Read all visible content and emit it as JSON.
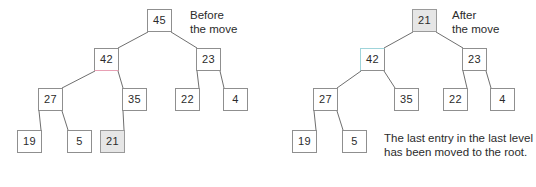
{
  "figure": {
    "panels": [
      {
        "id": "before",
        "label": "Before\nthe move",
        "label_pos": {
          "x": 190,
          "y": 8
        },
        "nodes": [
          {
            "id": "b45",
            "value": "45",
            "x": 147,
            "y": 9,
            "style": "plain"
          },
          {
            "id": "b42",
            "value": "42",
            "x": 94,
            "y": 48,
            "style": "accent-bottom"
          },
          {
            "id": "b23",
            "value": "23",
            "x": 196,
            "y": 48,
            "style": "plain"
          },
          {
            "id": "b27",
            "value": "27",
            "x": 38,
            "y": 88,
            "style": "plain"
          },
          {
            "id": "b35",
            "value": "35",
            "x": 122,
            "y": 88,
            "style": "plain"
          },
          {
            "id": "b22",
            "value": "22",
            "x": 175,
            "y": 88,
            "style": "plain"
          },
          {
            "id": "b4",
            "value": "4",
            "x": 223,
            "y": 88,
            "style": "plain"
          },
          {
            "id": "b19",
            "value": "19",
            "x": 17,
            "y": 130,
            "style": "plain"
          },
          {
            "id": "b5",
            "value": "5",
            "x": 67,
            "y": 130,
            "style": "plain"
          },
          {
            "id": "b21",
            "value": "21",
            "x": 100,
            "y": 130,
            "style": "highlight"
          }
        ],
        "edges": [
          {
            "from": "b45",
            "to": "b42"
          },
          {
            "from": "b45",
            "to": "b23"
          },
          {
            "from": "b42",
            "to": "b27"
          },
          {
            "from": "b42",
            "to": "b35"
          },
          {
            "from": "b23",
            "to": "b22"
          },
          {
            "from": "b23",
            "to": "b4"
          },
          {
            "from": "b27",
            "to": "b19"
          },
          {
            "from": "b27",
            "to": "b5"
          },
          {
            "from": "b35",
            "to": "b21"
          }
        ]
      },
      {
        "id": "after",
        "label": "After\nthe move",
        "label_pos": {
          "x": 452,
          "y": 8
        },
        "nodes": [
          {
            "id": "a21",
            "value": "21",
            "x": 412,
            "y": 9,
            "style": "highlight"
          },
          {
            "id": "a42",
            "value": "42",
            "x": 360,
            "y": 48,
            "style": "accent-top"
          },
          {
            "id": "a23",
            "value": "23",
            "x": 462,
            "y": 48,
            "style": "plain"
          },
          {
            "id": "a27",
            "value": "27",
            "x": 313,
            "y": 88,
            "style": "plain"
          },
          {
            "id": "a35",
            "value": "35",
            "x": 394,
            "y": 88,
            "style": "plain"
          },
          {
            "id": "a22",
            "value": "22",
            "x": 443,
            "y": 88,
            "style": "plain"
          },
          {
            "id": "a4",
            "value": "4",
            "x": 490,
            "y": 88,
            "style": "plain"
          },
          {
            "id": "a19",
            "value": "19",
            "x": 292,
            "y": 130,
            "style": "plain"
          },
          {
            "id": "a5",
            "value": "5",
            "x": 342,
            "y": 130,
            "style": "plain"
          }
        ],
        "edges": [
          {
            "from": "a21",
            "to": "a42"
          },
          {
            "from": "a21",
            "to": "a23"
          },
          {
            "from": "a42",
            "to": "a27"
          },
          {
            "from": "a42",
            "to": "a35"
          },
          {
            "from": "a23",
            "to": "a22"
          },
          {
            "from": "a23",
            "to": "a4"
          },
          {
            "from": "a27",
            "to": "a19"
          },
          {
            "from": "a27",
            "to": "a5"
          }
        ],
        "caption": "The last entry in the last level has been moved to the root.",
        "caption_pos": {
          "x": 384,
          "y": 131
        }
      }
    ],
    "colors": {
      "node_border": "#8f8f8f",
      "node_fill": "#ffffff",
      "highlight_fill": "#e6e6e6",
      "accent_pink": "#e8a0b4",
      "accent_cyan": "#9fd4da",
      "edge": "#6f6f6f",
      "text": "#2b2b2b",
      "background": "#ffffff"
    }
  }
}
